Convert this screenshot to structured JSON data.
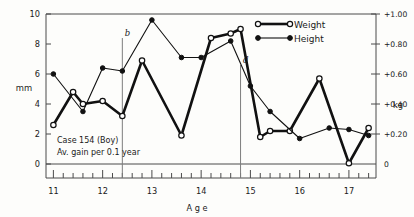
{
  "chart_data": {
    "type": "line",
    "title": "",
    "annotation_lines": [
      "Case 154 (Boy)",
      "Av. gain per 0.1 year"
    ],
    "xlabel": "Age",
    "ylabel": "mm",
    "y2label": "kg",
    "xlim": [
      10.85,
      17.55
    ],
    "ylim": [
      0,
      10
    ],
    "y2lim": [
      0,
      1.0
    ],
    "grid": false,
    "legend_position": "top-right",
    "x_ticks_major": [
      "11",
      "12",
      "13",
      "14",
      "15",
      "16",
      "17"
    ],
    "x_tick_major_values": [
      11,
      12,
      13,
      14,
      15,
      16,
      17
    ],
    "x_minor_ticks": [
      11.2,
      11.4,
      11.6,
      11.8,
      12.2,
      12.4,
      12.6,
      12.8,
      13.2,
      13.4,
      13.6,
      13.8,
      14.2,
      14.4,
      14.6,
      14.8,
      15.2,
      15.4,
      15.6,
      15.8,
      16.2,
      16.4,
      16.6,
      16.8,
      17.2,
      17.4
    ],
    "y_ticks": [
      "0",
      "2",
      "4",
      "6",
      "8",
      "10"
    ],
    "y_tick_values": [
      0,
      2,
      4,
      6,
      8,
      10
    ],
    "y2_ticks": [
      "0",
      "+0.20",
      "+0.40",
      "+0.60",
      "+0.80",
      "+1.00"
    ],
    "y2_tick_values": [
      0,
      0.2,
      0.4,
      0.6,
      0.8,
      1.0
    ],
    "markers": [
      {
        "label": "b",
        "x": 12.4,
        "y_top": 8.4
      },
      {
        "label": "d",
        "x": 14.8,
        "y_top": 6.6
      }
    ],
    "series": [
      {
        "name": "Weight",
        "unit": "kg",
        "axis": "right",
        "marker": "open-circle",
        "line_weight": "thick",
        "x": [
          11.0,
          11.4,
          11.6,
          12.0,
          12.4,
          12.8,
          13.6,
          14.2,
          14.6,
          14.8,
          15.2,
          15.4,
          15.8,
          16.4,
          17.0,
          17.4
        ],
        "values": [
          2.6,
          4.8,
          4.0,
          4.2,
          3.2,
          6.9,
          1.9,
          8.4,
          8.7,
          9.0,
          1.8,
          2.2,
          2.2,
          5.7,
          0.05,
          2.4
        ]
      },
      {
        "name": "Height",
        "unit": "mm",
        "axis": "left",
        "marker": "filled-circle",
        "line_weight": "thin",
        "x": [
          11.0,
          11.6,
          12.0,
          12.4,
          13.0,
          13.6,
          14.0,
          14.6,
          15.0,
          15.4,
          16.0,
          16.6,
          17.0,
          17.4
        ],
        "values": [
          6.0,
          3.5,
          6.4,
          6.2,
          9.6,
          7.1,
          7.1,
          8.2,
          5.2,
          3.5,
          1.7,
          2.4,
          2.3,
          1.9
        ]
      }
    ]
  },
  "legend": {
    "items": [
      {
        "label": "Weight",
        "marker": "open-circle"
      },
      {
        "label": "Height",
        "marker": "filled-circle"
      }
    ]
  },
  "axes": {
    "left_unit": "mm",
    "right_unit": "kg",
    "x_axis_title": "A g e"
  },
  "colors": {
    "ink": "#111111",
    "axis": "#4a4a4a",
    "marker_line": "#7d7d7d",
    "background": "#fdfdfb"
  }
}
